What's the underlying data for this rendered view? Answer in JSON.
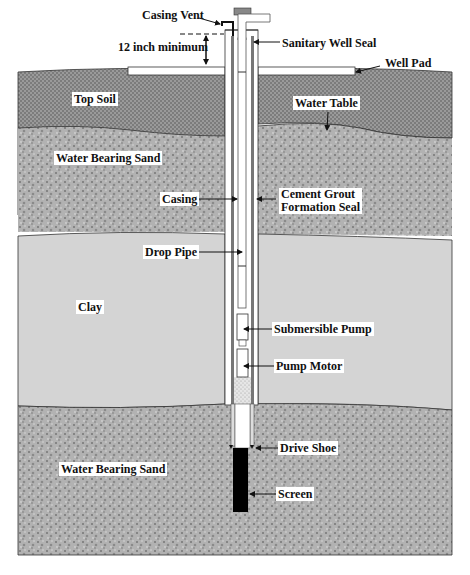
{
  "diagram": {
    "colors": {
      "top_soil": "#8e8e8e",
      "water_bearing_sand": "#a9a9a9",
      "clay": "#d4d4d4",
      "screen": "#000000",
      "outline": "#222222",
      "seal": "#888888"
    },
    "labels": {
      "casing_vent": "Casing Vent",
      "twelve_inch_minimum": "12 inch minimum",
      "sanitary_well_seal": "Sanitary Well Seal",
      "well_pad": "Well Pad",
      "top_soil": "Top Soil",
      "water_table": "Water Table",
      "water_bearing_sand_upper": "Water Bearing Sand",
      "casing": "Casing",
      "cement_grout_1": "Cement Grout",
      "cement_grout_2": "Formation Seal",
      "drop_pipe": "Drop Pipe",
      "clay": "Clay",
      "submersible_pump": "Submersible Pump",
      "pump_motor": "Pump Motor",
      "drive_shoe": "Drive Shoe",
      "water_bearing_sand_lower": "Water Bearing Sand",
      "screen": "Screen"
    },
    "layers": [
      {
        "name": "Top Soil"
      },
      {
        "name": "Water Bearing Sand"
      },
      {
        "name": "Clay"
      },
      {
        "name": "Water Bearing Sand"
      }
    ]
  }
}
